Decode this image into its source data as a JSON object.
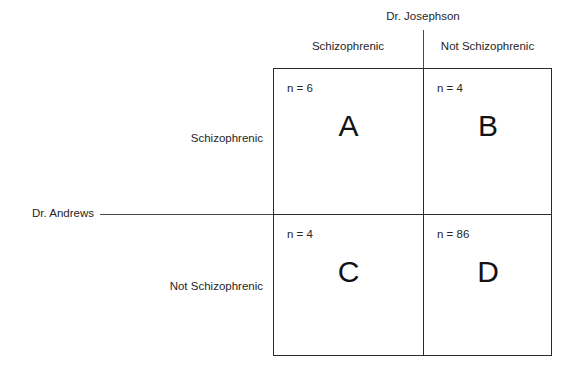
{
  "figure": {
    "background_color": "#ffffff",
    "line_color": "#2b2b2b",
    "leader_line_color": "#4a4a4a",
    "text_color": "#262626"
  },
  "raters": {
    "column_rater": "Dr. Josephson",
    "row_rater": "Dr. Andrews"
  },
  "column_headers": [
    {
      "label": "Schizophrenic"
    },
    {
      "label": "Not Schizophrenic"
    }
  ],
  "row_headers": [
    {
      "label": "Schizophrenic"
    },
    {
      "label": "Not Schizophrenic"
    }
  ],
  "cells": [
    {
      "id": "A",
      "label": "A",
      "count_text": "n = 6",
      "count": 6,
      "row": "Schizophrenic",
      "column": "Schizophrenic"
    },
    {
      "id": "B",
      "label": "B",
      "count_text": "n = 4",
      "count": 4,
      "row": "Schizophrenic",
      "column": "Not Schizophrenic"
    },
    {
      "id": "C",
      "label": "C",
      "count_text": "n = 4",
      "count": 4,
      "row": "Not Schizophrenic",
      "column": "Schizophrenic"
    },
    {
      "id": "D",
      "label": "D",
      "count_text": "n = 86",
      "count": 86,
      "row": "Not Schizophrenic",
      "column": "Not Schizophrenic"
    }
  ],
  "chart_data": {
    "type": "table",
    "title": "",
    "xlabel": "Dr. Josephson",
    "ylabel": "Dr. Andrews",
    "categories": [
      "Schizophrenic",
      "Not Schizophrenic"
    ],
    "row_categories": [
      "Schizophrenic",
      "Not Schizophrenic"
    ],
    "column_categories": [
      "Schizophrenic",
      "Not Schizophrenic"
    ],
    "cell_labels": [
      [
        "A",
        "B"
      ],
      [
        "C",
        "D"
      ]
    ],
    "values": [
      [
        6,
        4
      ],
      [
        4,
        86
      ]
    ],
    "value_prefix": "n = ",
    "grid": true,
    "legend": "none"
  }
}
